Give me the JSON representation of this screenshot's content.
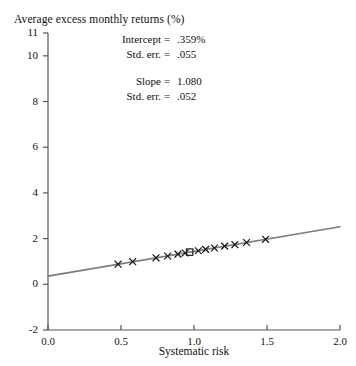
{
  "chart_data": {
    "type": "scatter",
    "title": "Average excess monthly returns (%)",
    "xlabel": "Systematic risk",
    "ylabel": "Average excess monthly returns (%)",
    "xlim": [
      0.0,
      2.0
    ],
    "ylim": [
      -2,
      11
    ],
    "grid": false,
    "legend": "none",
    "xticks": [
      "0.0",
      "0.5",
      "1.0",
      "1.5",
      "2.0"
    ],
    "xtick_values": [
      0.0,
      0.5,
      1.0,
      1.5,
      2.0
    ],
    "yticks": [
      "11",
      "10",
      "8",
      "6",
      "4",
      "2",
      "0",
      "-2"
    ],
    "ytick_values": [
      11,
      10,
      8,
      6,
      4,
      2,
      0,
      -2
    ],
    "series": [
      {
        "name": "portfolios",
        "marker": "x",
        "color": "#1a1a1a",
        "x": [
          0.48,
          0.58,
          0.74,
          0.82,
          0.89,
          0.94,
          1.03,
          1.08,
          1.14,
          1.21,
          1.28,
          1.36,
          1.49
        ],
        "y": [
          0.88,
          0.99,
          1.16,
          1.24,
          1.32,
          1.37,
          1.47,
          1.53,
          1.59,
          1.67,
          1.74,
          1.83,
          1.97
        ]
      },
      {
        "name": "market portfolio",
        "marker": "open-square",
        "color": "#1a1a1a",
        "x": [
          0.97
        ],
        "y": [
          1.41
        ]
      }
    ],
    "fit_line": {
      "name": "regression line",
      "color": "#7b7b7b",
      "intercept": 0.359,
      "slope": 1.08,
      "x_start": 0.0,
      "x_end": 2.0,
      "y_start": 0.359,
      "y_end": 2.519
    },
    "annotations": {
      "intercept_label": "Intercept",
      "intercept_eq": "=",
      "intercept_value": ".359%",
      "intercept_se_label": "Std. err.",
      "intercept_se_eq": "=",
      "intercept_se_value": ".055",
      "slope_label": "Slope",
      "slope_eq": "=",
      "slope_value": "1.080",
      "slope_se_label": "Std. err.",
      "slope_se_eq": "=",
      "slope_se_value": ".052"
    }
  },
  "colors": {
    "axis": "#555555",
    "line": "#7b7b7b",
    "marker": "#1a1a1a",
    "text": "#111111",
    "background": "#ffffff"
  }
}
